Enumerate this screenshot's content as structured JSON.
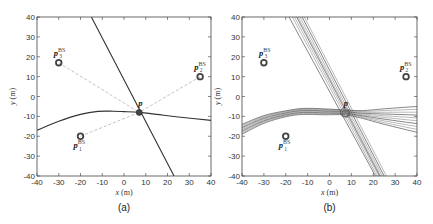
{
  "chart_data": [
    {
      "panel": "a",
      "caption": "(a)",
      "type": "scatter",
      "xlabel": "x (m)",
      "ylabel": "y (m)",
      "xlim": [
        -40,
        40
      ],
      "ylim": [
        -40,
        40
      ],
      "xticks": [
        -40,
        -30,
        -20,
        -10,
        0,
        10,
        20,
        30,
        40
      ],
      "yticks": [
        -40,
        -30,
        -20,
        -10,
        0,
        10,
        20,
        30,
        40
      ],
      "grid": false,
      "points": [
        {
          "name": "p1_BS",
          "label": "p",
          "sup": "BS",
          "sub": "1",
          "x": -20,
          "y": -20,
          "marker": "ring"
        },
        {
          "name": "p2_BS",
          "label": "p",
          "sup": "BS",
          "sub": "2",
          "x": 35,
          "y": 10,
          "marker": "ring"
        },
        {
          "name": "p3_BS",
          "label": "p",
          "sup": "BS",
          "sub": "3",
          "x": -30,
          "y": 17,
          "marker": "ring"
        },
        {
          "name": "p",
          "label": "p",
          "x": 7,
          "y": -8,
          "marker": "filled-dot"
        }
      ],
      "dashed_links": [
        {
          "from": "p1_BS",
          "to": "p"
        },
        {
          "from": "p2_BS",
          "to": "p"
        },
        {
          "from": "p3_BS",
          "to": "p"
        }
      ],
      "series": [
        {
          "name": "line",
          "type": "line",
          "x": [
            -15,
            23
          ],
          "y": [
            40,
            -40
          ]
        },
        {
          "name": "curve",
          "type": "line",
          "x": [
            -40,
            -30,
            -20,
            -12,
            -5,
            0,
            7,
            15,
            25,
            40
          ],
          "y": [
            -17,
            -12.5,
            -9,
            -7.5,
            -7.4,
            -7.6,
            -8,
            -9,
            -10.3,
            -12
          ]
        }
      ]
    },
    {
      "panel": "b",
      "caption": "(b)",
      "type": "scatter",
      "xlabel": "x (m)",
      "ylabel": "y (m)",
      "xlim": [
        -40,
        40
      ],
      "ylim": [
        -40,
        40
      ],
      "xticks": [
        -40,
        -30,
        -20,
        -10,
        0,
        10,
        20,
        30,
        40
      ],
      "yticks": [
        -40,
        -30,
        -20,
        -10,
        0,
        10,
        20,
        30,
        40
      ],
      "grid": false,
      "points": [
        {
          "name": "p1_BS",
          "label": "p",
          "sup": "BS",
          "sub": "1",
          "x": -20,
          "y": -20,
          "marker": "ring"
        },
        {
          "name": "p2_BS",
          "label": "p",
          "sup": "BS",
          "sub": "2",
          "x": 35,
          "y": 10,
          "marker": "ring"
        },
        {
          "name": "p3_BS",
          "label": "p",
          "sup": "BS",
          "sub": "3",
          "x": -30,
          "y": 17,
          "marker": "ring"
        },
        {
          "name": "p",
          "label": "p",
          "x": 7,
          "y": -8,
          "marker": "cluster"
        }
      ],
      "line_bundle": {
        "count": 8,
        "x_top_range": [
          -18,
          -12
        ],
        "x_bottom_range": [
          21,
          26
        ]
      },
      "curve_bundle": {
        "count": 10,
        "y_left_range": [
          -19,
          -14
        ],
        "y_right_range": [
          -18,
          -5
        ]
      }
    }
  ],
  "labels": {
    "xlabel_var": "x",
    "xlabel_unit": " (m)",
    "ylabel_var": "y",
    "ylabel_unit": " (m)",
    "caption_a": "(a)",
    "caption_b": "(b)",
    "p": "p",
    "bs": "BS",
    "sub1": "1",
    "sub2": "2",
    "sub3": "3",
    "ticks": [
      "-40",
      "-30",
      "-20",
      "-10",
      "0",
      "10",
      "20",
      "30",
      "40"
    ]
  }
}
